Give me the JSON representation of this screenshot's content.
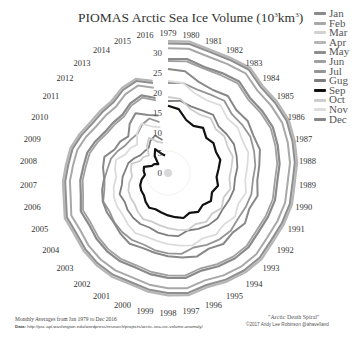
{
  "chart_data": {
    "type": "line",
    "subtype": "polar-spiral",
    "title_main": "PIOMAS Arctic Sea Ice Volume (10",
    "title_sup1": "3",
    "title_mid": "km",
    "title_sup2": "3",
    "title_end": ")",
    "angular_axis": {
      "label": "Year",
      "categories": [
        "1979",
        "1980",
        "1981",
        "1982",
        "1983",
        "1984",
        "1985",
        "1986",
        "1987",
        "1988",
        "1989",
        "1990",
        "1991",
        "1992",
        "1993",
        "1994",
        "1995",
        "1996",
        "1997",
        "1998",
        "1999",
        "2000",
        "2001",
        "2002",
        "2003",
        "2004",
        "2005",
        "2006",
        "2007",
        "2008",
        "2009",
        "2010",
        "2011",
        "2012",
        "2013",
        "2014",
        "2015",
        "2016"
      ],
      "direction": "clockwise",
      "start": "top"
    },
    "radial_axis": {
      "ticks": [
        0,
        5,
        10,
        15,
        20,
        25,
        30
      ],
      "range": [
        0,
        33
      ]
    },
    "legend_position": "top-right",
    "series": [
      {
        "name": "Jan",
        "color": "#8a8a8a",
        "width": 2.2,
        "values": [
          28.5,
          28.9,
          28.0,
          28.4,
          29.0,
          27.8,
          28.2,
          28.6,
          28.3,
          28.0,
          27.4,
          27.6,
          27.3,
          27.0,
          27.4,
          27.1,
          26.5,
          25.8,
          26.6,
          26.2,
          25.7,
          25.0,
          25.1,
          24.8,
          24.3,
          23.6,
          23.8,
          22.5,
          22.0,
          21.2,
          20.8,
          19.8,
          18.8,
          18.6,
          18.5,
          19.8,
          20.5,
          19.0
        ]
      },
      {
        "name": "Feb",
        "color": "#a8a8a8",
        "width": 2.0,
        "values": [
          31.2,
          31.5,
          30.8,
          31.0,
          31.6,
          30.4,
          30.8,
          31.2,
          30.9,
          30.6,
          30.0,
          30.2,
          29.9,
          29.6,
          30.0,
          29.7,
          29.1,
          28.4,
          29.2,
          28.8,
          28.3,
          27.6,
          27.7,
          27.4,
          26.9,
          26.2,
          26.4,
          25.1,
          24.6,
          23.8,
          23.4,
          22.4,
          21.4,
          21.2,
          21.1,
          22.4,
          23.1,
          21.6
        ]
      },
      {
        "name": "Mar",
        "color": "#d2d2d2",
        "width": 2.0,
        "values": [
          32.8,
          33.1,
          32.4,
          32.6,
          33.2,
          32.0,
          32.4,
          32.8,
          32.5,
          32.2,
          31.6,
          31.8,
          31.5,
          31.2,
          31.6,
          31.3,
          30.7,
          30.0,
          30.8,
          30.4,
          29.9,
          29.2,
          29.3,
          29.0,
          28.5,
          27.8,
          28.0,
          26.7,
          26.2,
          25.4,
          25.0,
          24.0,
          23.0,
          22.8,
          22.7,
          24.0,
          24.7,
          23.2
        ]
      },
      {
        "name": "Apr",
        "color": "#b5b5b5",
        "width": 2.0,
        "values": [
          33.0,
          33.3,
          32.6,
          32.8,
          33.4,
          32.2,
          32.6,
          33.0,
          32.7,
          32.4,
          31.8,
          32.0,
          31.7,
          31.4,
          31.8,
          31.5,
          30.9,
          30.2,
          31.0,
          30.6,
          30.1,
          29.4,
          29.5,
          29.2,
          28.7,
          28.0,
          28.2,
          26.9,
          26.4,
          25.6,
          25.2,
          24.2,
          23.2,
          23.0,
          22.9,
          24.2,
          24.9,
          23.4
        ]
      },
      {
        "name": "May",
        "color": "#8f8f8f",
        "width": 2.0,
        "values": [
          32.4,
          32.7,
          32.0,
          32.2,
          32.8,
          31.6,
          32.0,
          32.4,
          32.1,
          31.8,
          31.2,
          31.4,
          31.1,
          30.8,
          31.2,
          30.9,
          30.3,
          29.6,
          30.4,
          30.0,
          29.5,
          28.8,
          28.9,
          28.6,
          28.1,
          27.4,
          27.6,
          26.3,
          25.8,
          25.0,
          24.6,
          23.6,
          22.6,
          22.4,
          22.3,
          23.6,
          24.3,
          22.8
        ]
      },
      {
        "name": "Jun",
        "color": "#a0a0a0",
        "width": 1.8,
        "values": [
          28.0,
          28.3,
          27.6,
          27.8,
          28.4,
          27.2,
          27.6,
          28.0,
          27.7,
          27.4,
          26.8,
          27.0,
          26.7,
          26.4,
          26.8,
          26.5,
          25.9,
          25.2,
          26.0,
          25.6,
          25.1,
          24.4,
          24.5,
          24.2,
          23.7,
          23.0,
          23.2,
          21.9,
          21.4,
          20.6,
          20.2,
          19.2,
          18.2,
          18.0,
          17.9,
          19.2,
          19.9,
          18.4
        ]
      },
      {
        "name": "Jul",
        "color": "#959595",
        "width": 1.8,
        "values": [
          22.5,
          22.8,
          22.1,
          22.3,
          22.9,
          21.7,
          22.1,
          22.5,
          22.2,
          21.9,
          21.3,
          21.5,
          21.2,
          20.9,
          21.3,
          21.0,
          20.4,
          19.7,
          20.5,
          20.1,
          19.6,
          18.9,
          19.0,
          18.7,
          18.2,
          17.5,
          17.7,
          16.4,
          15.9,
          15.1,
          14.7,
          13.7,
          12.7,
          12.5,
          12.4,
          13.7,
          14.4,
          12.9
        ]
      },
      {
        "name": "Gug",
        "color": "#7e7e7e",
        "width": 1.8,
        "values": [
          18.0,
          18.3,
          17.6,
          17.8,
          18.4,
          17.2,
          17.6,
          18.0,
          17.7,
          17.4,
          16.8,
          17.0,
          16.7,
          16.4,
          16.8,
          16.5,
          15.9,
          15.2,
          16.0,
          15.6,
          15.1,
          14.4,
          14.5,
          14.2,
          13.7,
          13.0,
          13.2,
          11.9,
          11.4,
          10.6,
          10.2,
          9.2,
          8.2,
          8.0,
          7.9,
          9.2,
          9.9,
          8.4
        ]
      },
      {
        "name": "Sep",
        "color": "#111111",
        "width": 2.2,
        "values": [
          16.8,
          16.2,
          14.0,
          13.4,
          14.3,
          13.0,
          13.6,
          13.1,
          13.5,
          12.7,
          12.2,
          12.9,
          12.0,
          12.8,
          11.8,
          12.3,
          11.3,
          11.9,
          11.2,
          10.6,
          10.0,
          9.6,
          9.9,
          9.1,
          8.2,
          8.0,
          7.6,
          6.8,
          5.8,
          6.1,
          6.2,
          4.4,
          4.1,
          3.3,
          5.4,
          6.8,
          5.1,
          4.4
        ]
      },
      {
        "name": "Oct",
        "color": "#cccccc",
        "width": 1.8,
        "values": [
          19.0,
          18.8,
          17.0,
          16.6,
          17.4,
          16.2,
          16.8,
          16.3,
          16.7,
          15.9,
          15.4,
          16.1,
          15.2,
          16.0,
          15.0,
          15.5,
          14.5,
          15.1,
          14.4,
          13.8,
          13.2,
          12.8,
          13.1,
          12.3,
          11.4,
          11.2,
          10.8,
          10.0,
          9.0,
          9.3,
          9.4,
          7.6,
          7.3,
          6.5,
          8.6,
          10.0,
          8.3,
          7.6
        ]
      },
      {
        "name": "Nov",
        "color": "#dcdcdc",
        "width": 1.8,
        "values": [
          23.0,
          22.8,
          21.0,
          20.6,
          21.4,
          20.2,
          20.8,
          20.3,
          20.7,
          19.9,
          19.4,
          20.1,
          19.2,
          20.0,
          19.0,
          19.5,
          18.5,
          19.1,
          18.4,
          17.8,
          17.2,
          16.8,
          17.1,
          16.3,
          15.4,
          15.2,
          14.8,
          14.0,
          13.0,
          13.3,
          13.4,
          11.6,
          11.3,
          10.5,
          12.6,
          14.0,
          12.3,
          11.6
        ]
      },
      {
        "name": "Dec",
        "color": "#888888",
        "width": 2.0,
        "values": [
          26.0,
          25.8,
          24.0,
          23.6,
          24.4,
          23.2,
          23.8,
          23.3,
          23.7,
          22.9,
          22.4,
          23.1,
          22.2,
          23.0,
          22.0,
          22.5,
          21.5,
          22.1,
          21.4,
          20.8,
          20.2,
          19.8,
          20.1,
          19.3,
          18.4,
          18.2,
          17.8,
          17.0,
          16.0,
          16.3,
          16.4,
          14.6,
          14.3,
          13.5,
          15.6,
          17.0,
          15.3,
          14.6
        ]
      }
    ]
  },
  "legend": {
    "items": [
      {
        "label": "Jan",
        "color": "#8a8a8a"
      },
      {
        "label": "Feb",
        "color": "#a8a8a8"
      },
      {
        "label": "Mar",
        "color": "#d2d2d2"
      },
      {
        "label": "Apr",
        "color": "#b5b5b5"
      },
      {
        "label": "May",
        "color": "#8f8f8f"
      },
      {
        "label": "Jun",
        "color": "#a0a0a0"
      },
      {
        "label": "Jul",
        "color": "#959595"
      },
      {
        "label": "Gug",
        "color": "#7e7e7e"
      },
      {
        "label": "Sep",
        "color": "#111111"
      },
      {
        "label": "Oct",
        "color": "#cccccc"
      },
      {
        "label": "Nov",
        "color": "#dcdcdc"
      },
      {
        "label": "Dec",
        "color": "#888888"
      }
    ]
  },
  "footer": {
    "source_note": "Monthly Averages from Jan 1979 to Dec 2016",
    "data_label": "Data:",
    "data_url": "http://psc.apl.washington.edu/wordpress/research/projects/arctic-sea-ice-volume-anomaly/",
    "credit_title": "\"Arctic Death Spiral\"",
    "credit_author": "©2017 Andy Lee Robinson @ahavelland"
  }
}
